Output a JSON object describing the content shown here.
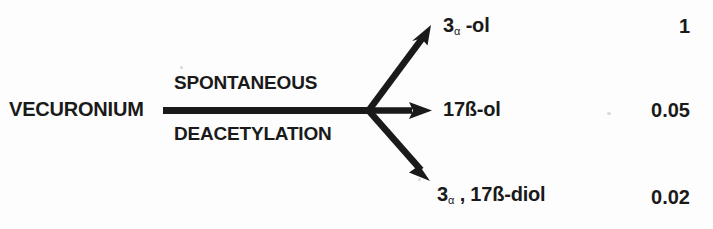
{
  "diagram": {
    "parent_drug": "VECURONIUM",
    "reaction_label_top": "SPONTANEOUS",
    "reaction_label_bottom": "DEACETYLATION",
    "alpha_symbol": "α",
    "products": [
      {
        "id": "3-alpha-ol",
        "prefix": "3",
        "alpha": "α",
        "suffix": " -ol",
        "value": "1"
      },
      {
        "id": "17-beta-ol",
        "prefix": "",
        "alpha": "",
        "suffix": "17ß-ol",
        "value": "0.05"
      },
      {
        "id": "3-alpha-17-beta-diol",
        "prefix": "3",
        "alpha": "α",
        "suffix": " , 17ß-diol",
        "value": "0.02"
      }
    ]
  },
  "colors": {
    "ink": "#1a1a1a",
    "background": "#fdfdfd"
  }
}
